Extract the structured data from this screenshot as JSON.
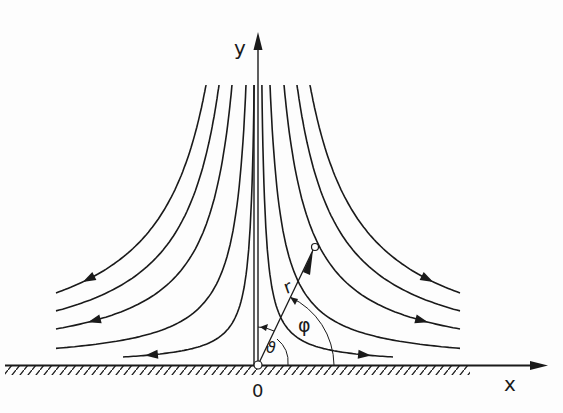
{
  "diagram": {
    "origin_px": [
      258,
      365
    ],
    "axes": {
      "x_label": "x",
      "y_label": "y",
      "origin_label": "0"
    },
    "polar": {
      "radius_label": "r",
      "angle_label_phi": "φ",
      "angle_label_theta": "ϑ"
    },
    "streamline_constants": [
      1080,
      3360,
      7280,
      10920,
      14560
    ],
    "wall_hatching": true,
    "colors": {
      "ink": "#1a1a1a",
      "background": "#fdfdfd"
    }
  }
}
